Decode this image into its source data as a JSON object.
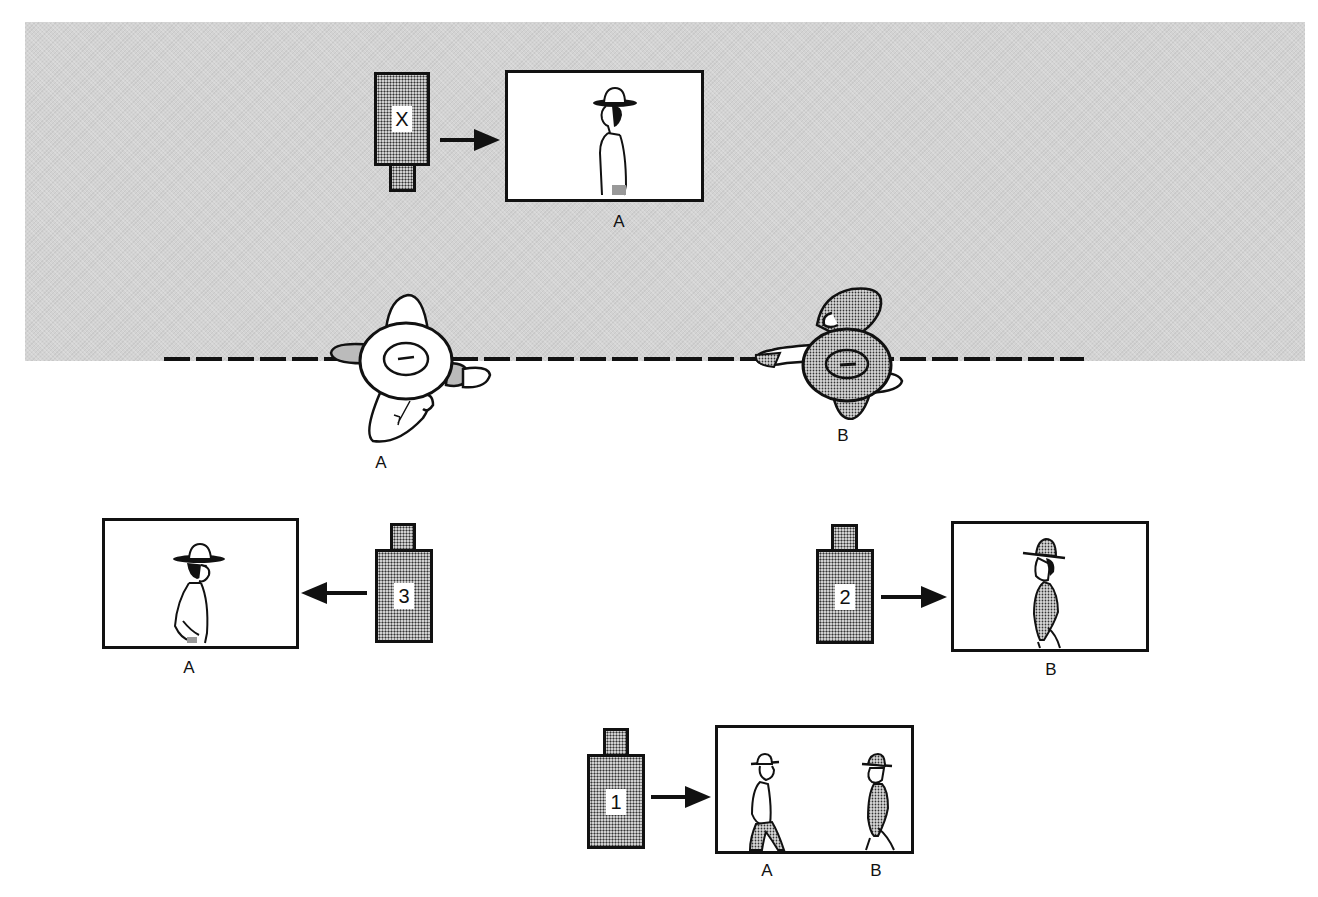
{
  "diagram": {
    "background_zone": {
      "color": "#d3d3d3",
      "description": "grey stippled region above the axis line"
    },
    "axis_line": {
      "style": "dashed",
      "color": "#111111"
    },
    "overhead_subjects": [
      {
        "id": "A",
        "label": "A",
        "fill": "white"
      },
      {
        "id": "B",
        "label": "B",
        "fill": "stippled"
      }
    ],
    "cameras": [
      {
        "id": "X",
        "label": "X",
        "direction": "right",
        "side": "grey"
      },
      {
        "id": "3",
        "label": "3",
        "direction": "left",
        "side": "white"
      },
      {
        "id": "2",
        "label": "2",
        "direction": "right",
        "side": "white"
      },
      {
        "id": "1",
        "label": "1",
        "direction": "right",
        "side": "white"
      }
    ],
    "frames": [
      {
        "camera": "X",
        "captions": [
          "A"
        ],
        "subject_facing": "left"
      },
      {
        "camera": "3",
        "captions": [
          "A"
        ],
        "subject_facing": "right"
      },
      {
        "camera": "2",
        "captions": [
          "B"
        ],
        "subject_facing": "left"
      },
      {
        "camera": "1",
        "captions": [
          "A",
          "B"
        ],
        "subject_facing": "A right, B left"
      }
    ],
    "labels": {
      "overhead_a": "A",
      "overhead_b": "B",
      "frame_x_caption": "A",
      "frame_3_caption": "A",
      "frame_2_caption": "B",
      "frame_1_caption_a": "A",
      "frame_1_caption_b": "B"
    }
  }
}
